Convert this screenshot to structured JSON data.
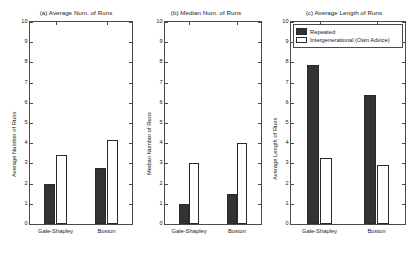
{
  "figure": {
    "background": "#ffffff",
    "series_colors": {
      "repeated": "#333333",
      "intergenerational": "#ffffff",
      "outline": "#2a2a2a"
    }
  },
  "legend": {
    "entries": [
      {
        "label": "Repeated",
        "style": "dark"
      },
      {
        "label": "Intergenerational (Own Advice)",
        "style": "light"
      }
    ]
  },
  "chart_data": [
    {
      "type": "bar",
      "panel": "a",
      "title": "(a) Average Num. of Runs",
      "xlabel": "",
      "ylabel": "Average Number of Runs",
      "categories": [
        "Gale-Shapley",
        "Boston"
      ],
      "ylim": [
        0,
        10
      ],
      "yticks": [
        0,
        1,
        2,
        3,
        4,
        5,
        6,
        7,
        8,
        9,
        10
      ],
      "grid": false,
      "legend_position": "none",
      "series": [
        {
          "name": "Repeated",
          "values": [
            1.97,
            2.75
          ]
        },
        {
          "name": "Intergenerational (Own Advice)",
          "values": [
            3.42,
            4.18
          ]
        }
      ]
    },
    {
      "type": "bar",
      "panel": "b",
      "title": "(b) Median Num. of Runs",
      "xlabel": "",
      "ylabel": "Median Number of Runs",
      "categories": [
        "Gale-Shapley",
        "Boston"
      ],
      "ylim": [
        0,
        10
      ],
      "yticks": [
        0,
        1,
        2,
        3,
        4,
        5,
        6,
        7,
        8,
        9,
        10
      ],
      "grid": false,
      "legend_position": "none",
      "series": [
        {
          "name": "Repeated",
          "values": [
            1.0,
            1.5
          ]
        },
        {
          "name": "Intergenerational (Own Advice)",
          "values": [
            3.0,
            4.0
          ]
        }
      ]
    },
    {
      "type": "bar",
      "panel": "c",
      "title": "(c) Average Length of Runs",
      "xlabel": "",
      "ylabel": "Average Length of Runs",
      "categories": [
        "Gale-Shapley",
        "Boston"
      ],
      "ylim": [
        0,
        10
      ],
      "yticks": [
        0,
        1,
        2,
        3,
        4,
        5,
        6,
        7,
        8,
        9,
        10
      ],
      "grid": false,
      "legend_position": "upper-left-inside",
      "series": [
        {
          "name": "Repeated",
          "values": [
            7.87,
            6.37
          ]
        },
        {
          "name": "Intergenerational (Own Advice)",
          "values": [
            3.25,
            2.92
          ]
        }
      ]
    }
  ]
}
